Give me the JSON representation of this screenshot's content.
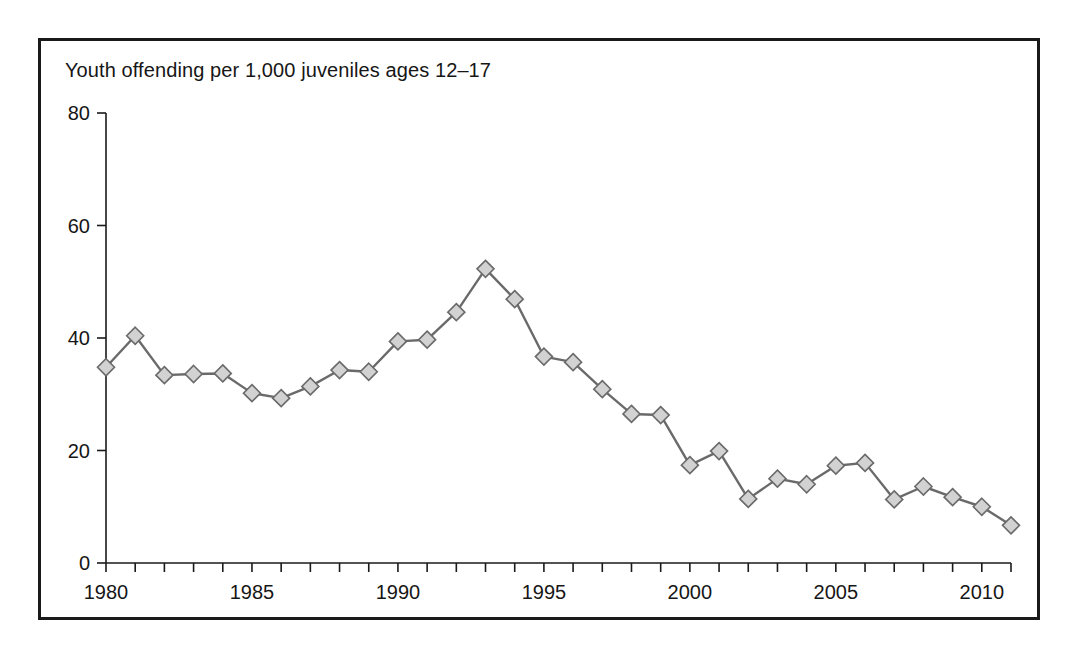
{
  "figure": {
    "title": "Youth offending per 1,000 juveniles ages 12–17",
    "frame_color": "#1a1a1a",
    "background": "#ffffff"
  },
  "chart_data": {
    "type": "line",
    "title": "Youth offending per 1,000 juveniles ages 12–17",
    "xlabel": "",
    "ylabel": "",
    "xlim": [
      1980,
      2011
    ],
    "ylim": [
      0,
      80
    ],
    "grid": false,
    "legend": null,
    "yticks": [
      0,
      20,
      40,
      60,
      80
    ],
    "ytick_labels": [
      "0",
      "20",
      "40",
      "60",
      "80"
    ],
    "xticks": [
      1980,
      1981,
      1982,
      1983,
      1984,
      1985,
      1986,
      1987,
      1988,
      1989,
      1990,
      1991,
      1992,
      1993,
      1994,
      1995,
      1996,
      1997,
      1998,
      1999,
      2000,
      2001,
      2002,
      2003,
      2004,
      2005,
      2006,
      2007,
      2008,
      2009,
      2010,
      2011
    ],
    "xtick_labels_shown": [
      "1980",
      "1985",
      "1990",
      "1995",
      "2000",
      "2005",
      "2010"
    ],
    "xtick_labels_shown_at": [
      1980,
      1985,
      1990,
      1995,
      2000,
      2005,
      2010
    ],
    "marker": "diamond",
    "marker_face_color": "#d2d2d2",
    "marker_edge_color": "#6a6a6a",
    "line_color": "#6a6a6a",
    "x": [
      1980,
      1981,
      1982,
      1983,
      1984,
      1985,
      1986,
      1987,
      1988,
      1989,
      1990,
      1991,
      1992,
      1993,
      1994,
      1995,
      1996,
      1997,
      1998,
      1999,
      2000,
      2001,
      2002,
      2003,
      2004,
      2005,
      2006,
      2007,
      2008,
      2009,
      2010,
      2011
    ],
    "values": [
      34.8,
      40.4,
      33.4,
      33.6,
      33.7,
      30.2,
      29.3,
      31.4,
      34.3,
      34.0,
      39.4,
      39.7,
      44.6,
      52.3,
      46.9,
      36.7,
      35.7,
      30.9,
      26.5,
      26.3,
      17.4,
      19.9,
      11.4,
      15.0,
      14.0,
      17.3,
      17.8,
      11.3,
      13.6,
      11.7,
      10.0,
      6.7
    ]
  }
}
